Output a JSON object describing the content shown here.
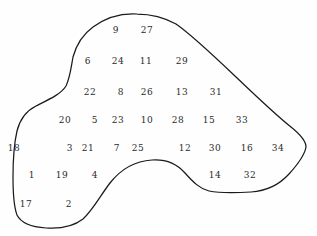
{
  "figure": {
    "name": "numbered-region-diagram",
    "background_color": "#fefefe",
    "outline_color": "#1a1a1a",
    "label_color": "#2b2b2b",
    "width": 317,
    "height": 236
  },
  "chart_data": {
    "type": "scatter",
    "title": "",
    "subtitle": "",
    "xlabel": "",
    "ylabel": "",
    "xlim": [
      0,
      317
    ],
    "ylim": [
      0,
      236
    ],
    "grid": false,
    "legend": null,
    "annotations": [
      "Closed irregular blob outline enclosing 34 numbered points arranged in rows"
    ],
    "series": [
      {
        "name": "numbered-points",
        "points": [
          {
            "label": "9",
            "x": 116,
            "y": 30
          },
          {
            "label": "27",
            "x": 147,
            "y": 30
          },
          {
            "label": "6",
            "x": 88,
            "y": 61
          },
          {
            "label": "24",
            "x": 118,
            "y": 61
          },
          {
            "label": "11",
            "x": 146,
            "y": 61
          },
          {
            "label": "29",
            "x": 182,
            "y": 61
          },
          {
            "label": "22",
            "x": 90,
            "y": 92
          },
          {
            "label": "8",
            "x": 121,
            "y": 92
          },
          {
            "label": "26",
            "x": 147,
            "y": 92
          },
          {
            "label": "13",
            "x": 182,
            "y": 92
          },
          {
            "label": "31",
            "x": 216,
            "y": 92
          },
          {
            "label": "20",
            "x": 65,
            "y": 120
          },
          {
            "label": "5",
            "x": 95,
            "y": 120
          },
          {
            "label": "23",
            "x": 118,
            "y": 120
          },
          {
            "label": "10",
            "x": 147,
            "y": 120
          },
          {
            "label": "28",
            "x": 178,
            "y": 120
          },
          {
            "label": "15",
            "x": 209,
            "y": 120
          },
          {
            "label": "33",
            "x": 242,
            "y": 120
          },
          {
            "label": "18",
            "x": 14,
            "y": 148
          },
          {
            "label": "3",
            "x": 70,
            "y": 148
          },
          {
            "label": "21",
            "x": 88,
            "y": 148
          },
          {
            "label": "7",
            "x": 117,
            "y": 148
          },
          {
            "label": "25",
            "x": 138,
            "y": 148
          },
          {
            "label": "12",
            "x": 185,
            "y": 148
          },
          {
            "label": "30",
            "x": 215,
            "y": 148
          },
          {
            "label": "16",
            "x": 247,
            "y": 148
          },
          {
            "label": "34",
            "x": 278,
            "y": 148
          },
          {
            "label": "1",
            "x": 32,
            "y": 175
          },
          {
            "label": "19",
            "x": 62,
            "y": 175
          },
          {
            "label": "4",
            "x": 95,
            "y": 175
          },
          {
            "label": "14",
            "x": 215,
            "y": 175
          },
          {
            "label": "32",
            "x": 250,
            "y": 175
          },
          {
            "label": "17",
            "x": 26,
            "y": 204
          },
          {
            "label": "2",
            "x": 69,
            "y": 204
          }
        ]
      }
    ],
    "outline_path": "M 137 14 C 120 13 104 19 93 27 C 82 35 76 46 73 57 C 71 68 70 78 66 86 C 61 94 50 99 36 106 C 26 111 20 119 17 131 C 14 144 13 160 13 177 C 13 193 14 207 17 215 C 21 223 31 227 46 228 C 61 229 74 226 83 219 C 93 210 100 196 110 183 C 121 169 135 161 152 160 C 167 159 177 164 185 173 C 193 182 200 189 209 191 C 219 193 234 193 251 192 C 266 191 279 185 289 174 C 299 163 305 153 306 147 C 306 141 301 135 291 127 C 277 116 258 98 236 77 C 214 56 192 35 176 24 C 162 16 150 14 137 14 Z"
  }
}
